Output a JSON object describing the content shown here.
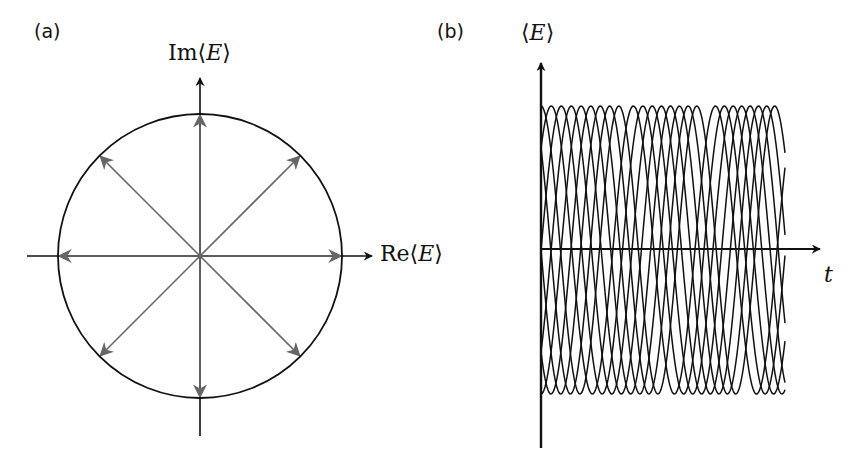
{
  "panel_a": {
    "tag": "(a)",
    "x_label_prefix": "Re⟨",
    "x_label_var": "E",
    "x_label_suffix": "⟩",
    "y_label_prefix": "Im⟨",
    "y_label_var": "E",
    "y_label_suffix": "⟩",
    "circle": {
      "cx": 200,
      "cy": 256,
      "r": 142,
      "stroke": "#111111"
    },
    "arrow_color": "#666666",
    "arrow_angles_deg": [
      0,
      45,
      90,
      135,
      180,
      225,
      270,
      315
    ],
    "axes": {
      "x_from": 27,
      "x_to": 372,
      "y_from": 436,
      "y_to": 78
    }
  },
  "panel_b": {
    "tag": "(b)",
    "y_label_prefix": "⟨",
    "y_label_var": "E",
    "y_label_suffix": "⟩",
    "x_label": "t",
    "axes": {
      "origin_x": 541,
      "origin_y": 249,
      "x_to": 820,
      "y_top": 63,
      "y_bottom": 448
    },
    "signal": {
      "x_start": 541,
      "x_end": 785,
      "center_y": 250,
      "amplitude": 144,
      "num_curves": 8,
      "base_period_px": 80,
      "period_spread": 0.06,
      "stroke": "#111111"
    }
  },
  "chart_data": {
    "type": "line",
    "title": "",
    "panels": [
      {
        "id": "a",
        "description": "Phasor diagram: unit circle in complex plane with 8 phasors at equally spaced phases",
        "xlabel": "Re⟨E⟩",
        "ylabel": "Im⟨E⟩",
        "phasor_angles_deg": [
          0,
          45,
          90,
          135,
          180,
          225,
          270,
          315
        ],
        "magnitude": 1
      },
      {
        "id": "b",
        "description": "Overlaid oscillating expectation values with equal amplitude and different phases",
        "xlabel": "t",
        "ylabel": "⟨E⟩",
        "ylim": [
          -1,
          1
        ],
        "num_curves": 8
      }
    ]
  }
}
